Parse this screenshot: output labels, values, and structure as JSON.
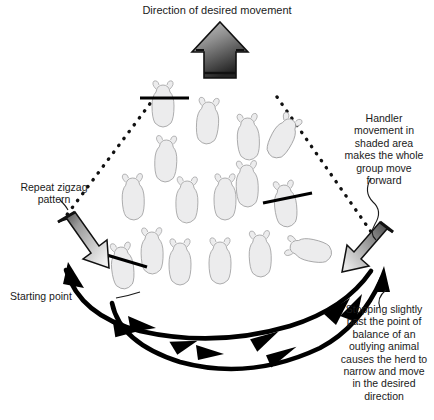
{
  "figure": {
    "title": "Direction of desired movement",
    "type": "livestock handling diagram",
    "labels": {
      "title": "Direction of desired movement",
      "handler": "Handler\nmovement in\nshaded area\nmakes the whole\ngroup move\nforward",
      "zigzag": "Repeat zigzag\npattern",
      "starting_point": "Starting point",
      "stopping": "Stopping slightly\npast the point of\nbalance of an\noutlying animal\ncauses the herd to\nnarrow and move\nin the desired\ndirection"
    },
    "colors": {
      "ink": "#1a1a1a",
      "animal_fill": "#ececed",
      "animal_outline": "#9b9b9c",
      "arrow_dark": "#2a2a2a",
      "arrow_light": "#d9d9d9",
      "background": "#ffffff"
    },
    "elements": {
      "direction_arrow": "up-arrow-gradient",
      "handler_arrow_left": "down-right-arrow-gradient",
      "handler_arrow_right": "down-left-arrow-gradient",
      "inner_path_direction": "leftward",
      "outer_path_direction": "rightward",
      "guide_lines": "dotted-v-shape",
      "balance_bars": 3,
      "animal_count": 17
    }
  }
}
